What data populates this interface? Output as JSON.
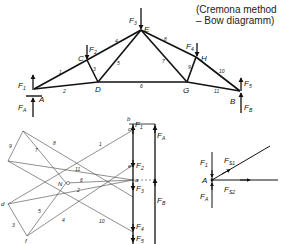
{
  "caption": {
    "line1": "(Cremona method",
    "line2": "– Bow diagramm)"
  },
  "truss": {
    "nodes": {
      "A": "A",
      "B": "B",
      "C": "C",
      "D": "D",
      "E": "E",
      "G": "G",
      "H": "H"
    },
    "forces": {
      "F1": "F",
      "F1_sub": "1",
      "F2": "F",
      "F2_sub": "2",
      "F3": "F",
      "F3_sub": "3",
      "F4": "F",
      "F4_sub": "4",
      "F5": "F",
      "F5_sub": "5",
      "FA": "F",
      "FA_sub": "A",
      "FB": "F",
      "FB_sub": "B"
    },
    "members": [
      "1",
      "2",
      "3",
      "4",
      "5",
      "6",
      "7",
      "8",
      "9",
      "10",
      "11"
    ]
  },
  "force_polygon": {
    "points": {
      "a": "a",
      "b": "b",
      "c": "c",
      "d": "d",
      "e": "e",
      "f": "f",
      "N": "N"
    },
    "member_labels": [
      "1",
      "2",
      "3",
      "4",
      "5",
      "6",
      "7",
      "8",
      "9",
      "10",
      "11"
    ],
    "load_labels": {
      "F1": "F",
      "F1_sub": "1",
      "F2": "F",
      "F2_sub": "2",
      "F3": "F",
      "F3_sub": "3",
      "F4": "F",
      "F4_sub": "4",
      "F5": "F",
      "F5_sub": "5",
      "FA": "F",
      "FA_sub": "A",
      "FB": "F",
      "FB_sub": "B"
    }
  },
  "node_A_detail": {
    "node": "A",
    "F1": "F",
    "F1_sub": "1",
    "FA": "F",
    "FA_sub": "A",
    "FS1": "F",
    "FS1_sub": "S1",
    "FS2": "F",
    "FS2_sub": "S2"
  }
}
